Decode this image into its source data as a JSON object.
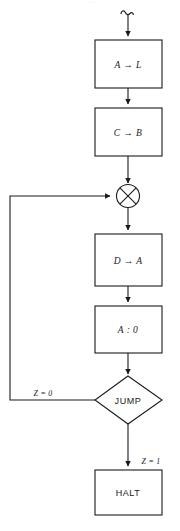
{
  "figure": {
    "type": "flowchart",
    "title": "",
    "top_caption_fragment": "· ·",
    "background_color": "#ffffff",
    "line_color": "#1a1a1a",
    "text_color": "#1a1a1a"
  },
  "nodes": {
    "entry": {
      "name": "start-hook",
      "shape": "curl-arrow",
      "label": ""
    },
    "box_a_to_l": {
      "shape": "rectangle",
      "label": "A → L"
    },
    "box_c_to_b": {
      "shape": "rectangle",
      "label": "C → B"
    },
    "junction": {
      "shape": "circle-x",
      "label": ""
    },
    "box_d_to_a": {
      "shape": "rectangle",
      "label": "D → A"
    },
    "box_a_compare_0": {
      "shape": "rectangle",
      "label": "A : 0"
    },
    "decision_jump": {
      "shape": "diamond",
      "label": "JUMP"
    },
    "box_halt": {
      "shape": "rectangle",
      "label": "HALT"
    }
  },
  "edges": {
    "branch_false_label": "Z = 0",
    "branch_true_label": "Z = 1"
  }
}
